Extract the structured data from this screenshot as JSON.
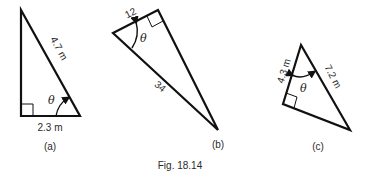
{
  "figure": {
    "caption": "Fig. 18.14",
    "theta_symbol": "θ",
    "stroke_color": "#111111",
    "panels": [
      {
        "id": "a",
        "label": "(a)",
        "hypotenuse": "4.7 m",
        "adjacent": "2.3 m"
      },
      {
        "id": "b",
        "label": "(b)",
        "short_side": "12",
        "hypotenuse": "34"
      },
      {
        "id": "c",
        "label": "(c)",
        "adjacent": "4.3 m",
        "hypotenuse": "7.2 m"
      }
    ]
  }
}
